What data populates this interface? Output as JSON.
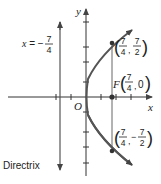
{
  "diagram": {
    "type": "parabola",
    "equation_implied": "y^2 = 7x",
    "axes": {
      "x_label": "x",
      "y_label": "y",
      "origin_label": "O"
    },
    "directrix": {
      "equation_prefix": "x = −",
      "numerator": "7",
      "denominator": "4",
      "label": "Directrix"
    },
    "focus": {
      "prefix": "F",
      "x_num": "7",
      "x_den": "4",
      "y": "0"
    },
    "point_upper": {
      "x_num": "7",
      "x_den": "4",
      "y_num": "7",
      "y_den": "2",
      "y_sign": ""
    },
    "point_lower": {
      "x_num": "7",
      "x_den": "4",
      "y_num": "7",
      "y_den": "2",
      "y_sign": "−"
    },
    "colors": {
      "curve": "#555555",
      "axes": "#333333",
      "text": "#222222"
    }
  }
}
